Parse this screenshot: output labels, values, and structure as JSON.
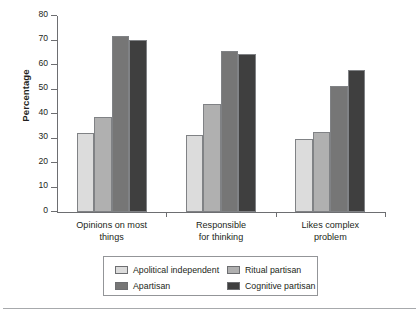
{
  "chart_data": {
    "type": "bar",
    "title": "",
    "xlabel": "",
    "ylabel": "Percentage",
    "ylim": [
      0,
      80
    ],
    "yticks": [
      0,
      10,
      20,
      30,
      40,
      50,
      60,
      70,
      80
    ],
    "ytick_labels": [
      "0",
      "10",
      "20",
      "30",
      "40",
      "50",
      "60",
      "70",
      "80"
    ],
    "grid": false,
    "legend_position": "bottom",
    "categories": [
      "Opinions on most things",
      "Responsible for thinking",
      "Likes complex problem"
    ],
    "category_lines": [
      [
        "Opinions on most",
        "things"
      ],
      [
        "Responsible",
        "for thinking"
      ],
      [
        "Likes complex",
        "problem"
      ]
    ],
    "series": [
      {
        "name": "Apolitical independent",
        "color": "#dcdcdc",
        "values": [
          32.3,
          31.5,
          30.0
        ]
      },
      {
        "name": "Ritual partisan",
        "color": "#b0b0b0",
        "values": [
          38.9,
          43.9,
          32.6
        ]
      },
      {
        "name": "Apartisan",
        "color": "#767676",
        "values": [
          71.9,
          65.8,
          51.4
        ]
      },
      {
        "name": "Cognitive partisan",
        "color": "#3f3f3f",
        "values": [
          70.4,
          64.6,
          57.9
        ]
      }
    ]
  },
  "legend": {
    "entries": [
      {
        "label": "Apolitical independent",
        "color": "#dcdcdc"
      },
      {
        "label": "Ritual partisan",
        "color": "#b0b0b0"
      },
      {
        "label": "Apartisan",
        "color": "#767676"
      },
      {
        "label": "Cognitive partisan",
        "color": "#3f3f3f"
      }
    ]
  }
}
